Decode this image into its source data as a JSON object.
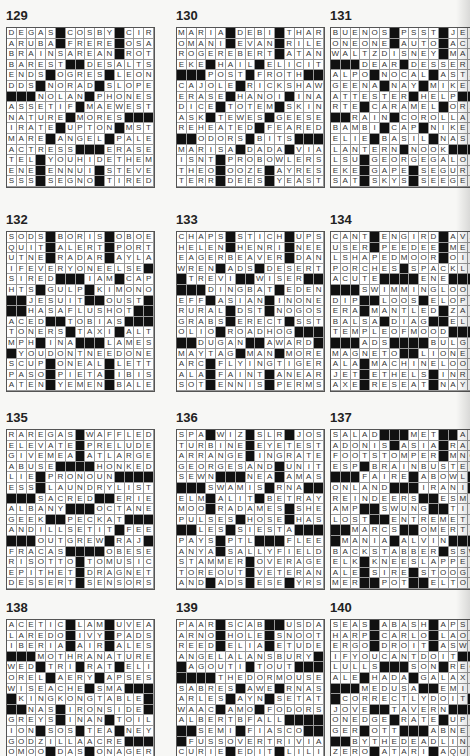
{
  "puzzles": [
    {
      "number": "129",
      "rows": [
        "DEGAS#COSBY#CIR",
        "ARUBA#FRERE#OSA",
        "BRAINSAREAN#ROT",
        "BAREST##DESALTS",
        "ENDS#OGRES#LEON",
        "DDS#NORAD#SLOPE",
        "###NOLAN#PHONES",
        "ASSETIF#MAEWEST",
        "NATURE#MORES###",
        "IRATE#UPTON#MST",
        "MARE#ANGEL#PALE",
        "ACTRESS###ERASER",
        "TEL#YOUHIDETHEM",
        "ENE#ENNUI#STEVE",
        "SSS#SEGNO#TIRED"
      ]
    },
    {
      "number": "130",
      "rows": [
        "MARIA#DEBI#THAR",
        "OMANI#EVAN#RILE",
        "ROGEREBERT#ATAN",
        "EKE#HAIL#ELICIT",
        "###POST#FROTH##",
        "CAJOLE#RICKSHAW",
        "ERASE#HANOI#INA",
        "DICE#TOTEM#SKIN",
        "ASK#TEWES#GEESE",
        "REHEATED#FEARED",
        "##ODORS#BITS###",
        "MARISA#DADA#VIA",
        "ISNT#PROBOWLERS",
        "THEO#OOZE#AYRES",
        "TERR#DEES#YEAST"
      ]
    },
    {
      "number": "131",
      "rows": [
        "BUENOS#PSST#JED",
        "ONEONE#AUTO#ACE",
        "WALTZDISNEY#MAL",
        "###DEAR#DESSERT",
        "ALPO#NOCAL#ASTA",
        "GEENA#NAY#MIKES",
        "ATTESTER#HELP##",
        "RTE#CARAMEL#ORA",
        "##RAIN#COROLLAS",
        "BAMBI#CAP#NIKES",
        "ELIE#BASIL#NAST",
        "LANTERN#NOOK###",
        "LSU#GEORGEGALOP",
        "EKE#GAPE#SEGURA",
        "SAT#SKYS#SEEGER"
      ]
    },
    {
      "number": "132",
      "rows": [
        "SODS#BORIS#OBOE",
        "QUIT#ALERT#PORT",
        "UTNE#RADAR#AYLA",
        "IFEVERYONEELSE#",
        "SIRED###IAM#CAP",
        "HTS#GULP#KIMONO",
        "##JESUIT##OUST#",
        "##HASAFLUSHOT##",
        "ACED##TOBIAS###",
        "TONERS#TAXI#ALT",
        "MPH#INA###LAMES",
        "#YOUDONTNEEDONE",
        "SCUP#ONEAL#LETT",
        "PASO#PIETA#IBIS",
        "ATEN#YEMEN#BALE"
      ]
    },
    {
      "number": "133",
      "rows": [
        "CHAPS#STICH#UPS",
        "HELEN#HENRI#NEE",
        "EAGERBEAVER#DAN",
        "WREN#ADS#DESERT",
        "#TREVI##WISER##",
        "###DINGBAT#EDEN",
        "EFF#ASIAN#INONE",
        "RURAL#DST#NOGOS",
        "GRABS#ERECT#SST",
        "OLIO#ROADHOG###",
        "##DUGAN##AWARD#",
        "MAYTAG#MAN#MORE",
        "ARC#FLYINGTIGER",
        "ALA#FAINT#ANEAR",
        "SOT#ENNIS#PERMS"
      ]
    },
    {
      "number": "134",
      "rows": [
        "CANT#ENGIRD#AVA",
        "USER#PEEDEE#MEX",
        "LSHAPEDMOOR#OIL",
        "PORCHES#SPACKLE",
        "ACUTE####ENE###",
        "###SWIMMINGLOOP",
        "DIP##LOOS#ELOPE",
        "ERA#MANTLED#ZAP",
        "BALSA#DIAG##ELS",
        "TEMPLEOFMOOD###",
        "###ADS####BULGE",
        "MAGNETO##LIONELS",
        "ALA#MACHINELOOT",
        "JET#ETHELS#INRE",
        "AXE#RESEAT#NAYS"
      ]
    },
    {
      "number": "135",
      "rows": [
        "RAREGAS#WAFFLED",
        "ELEVATE#PRELUDE",
        "GIVEMEA#ATLARGE",
        "ABUSE####HONKED",
        "LIE#PRONOUN####",
        "ESS#LAUNDRYLIST",
        "###SACRED##ERIE",
        "ALBANY###OCTANE",
        "GEEK##PECKAT###",
        "ANDILLSETIT#FEE",
        "###OUTGREW#RAJ",
        "FRACAS####OBESE",
        "RISOTTO#TOMUSIC",
        "EPITHET#DRAGNET",
        "DESSERT#SENSORS"
      ]
    },
    {
      "number": "136",
      "rows": [
        "SPA#WIZ#SLR#JOS",
        "TURBINE#EYETEST",
        "ARRANGE#INGRATE",
        "GEORGESAND#UNIT",
        "SEWN###NEA#AMAS",
        "###SWAMIS#RNA##",
        "ELM#ALIT#BETRAY",
        "MOO#RADAMES#SHE",
        "PULSES#HOSE#HAS",
        "##LES#SIESTA###",
        "PAYS#PTL###FLEE",
        "ANYA#SALLYFIELD",
        "STAMMER#OVERAGE",
        "TOREOUT#VETERAN",
        "AND#ADS#ESE#YRS"
      ]
    },
    {
      "number": "137",
      "rows": [
        "SALAD###MET##APT",
        "ADONIS#ASIA#RAH",
        "FOOTSTOMPER#MNO",
        "ESP#BRAINBUSTER",
        "###FAIRE#ABOWL#",
        "ONLAND###IRANI#",
        "REINDEERS##ESME",
        "AMP##SWUNG##TIL",
        "LOST##ENTREMETS",
        "##MARCS##OMERTA",
        "#MANIA#ALVIN###",
        "BACKSTABBER#SSW",
        "ELK#KNEESLAPPER",
        "ALE#SIRE#STOOGE",
        "MER##POT##ELTON"
      ]
    },
    {
      "number": "138",
      "rows": [
        "ACETIC#LAM#UVEA",
        "LAREDO#IVY#PADS",
        "IBERIA#AIR#ALES",
        "###MOTHRANATURE",
        "WED#TRI#RAT#ELI",
        "OREL#AERY#APSES",
        "WISEACHE#SMA###",
        "#KINGKONGTABLE#",
        "##NAS#IRONSIDE#",
        "GREYS#INAN#TOIL",
        "ION#SOS#TEA#NEY",
        "GODZILLAACRE###",
        "OMOO#DAS#ONAGER",
        "TIRE#INK#LITERS",
        "TEAS#EDS#DESERT"
      ]
    },
    {
      "number": "139",
      "rows": [
        "PAAR#SCAB##USDA",
        "ARNO#HOLE#SNOOT",
        "REED#ELIA#ETUDE",
        "ANGELALANSBURY#",
        "#AGOUTI#TOUT###",
        "####THEDORMOUSE",
        "SABRES#AWE#RNAS",
        "ARLES#AYN#SETAT",
        "WAAC#AMO#FODORS",
        "ALBERTBFALL####",
        "##SEMI#FIASCO##",
        "#FUSSOVERTRIVIA",
        "CURIE#EDIT#LILI",
        "INGOT#RICE#LIED",
        "ADEN##TEAR#SIRE"
      ]
    },
    {
      "number": "140",
      "rows": [
        "SEAS#ABASH#APSE",
        "HARP#CARLO#LAOS",
        "ERGO#DROIT#ASWE",
        "IFYOUCANTDOIT##",
        "LULLS###SON#REO",
        "ALE#HADA#GALAXY",
        "###MEDUSA##EMIL",
        "#CORRECTLYDOIT#",
        "JOVE##TAVERN###",
        "ONEDGE#RATE#UPC",
        "GER#OTT###ABNER",
        "##BYTHEDEADLINE",
        "ZERO#ATARI#AQUA",
        "EVER#NOTIN#SULK",
        "DADE#ENACT#SETS"
      ]
    }
  ],
  "layout": {
    "columns_x": [
      6,
      176,
      330
    ],
    "rows_y": [
      8,
      212,
      410,
      600
    ]
  }
}
